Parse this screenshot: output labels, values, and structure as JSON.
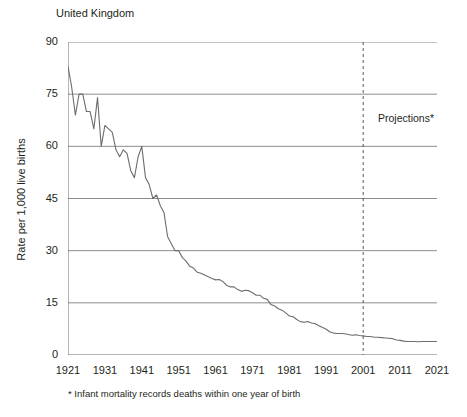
{
  "chart_data": {
    "type": "line",
    "title": "United Kingdom",
    "xlabel": "",
    "ylabel": "Rate per 1,000 live births",
    "xlim": [
      1921,
      2021
    ],
    "ylim": [
      0,
      90
    ],
    "grid": true,
    "legend": false,
    "y_ticks": [
      0,
      15,
      30,
      45,
      60,
      75,
      90
    ],
    "y_tick_labels": [
      "0",
      "15",
      "30",
      "45",
      "60",
      "75",
      "90"
    ],
    "x_ticks": [
      1921,
      1931,
      1941,
      1951,
      1961,
      1971,
      1981,
      1991,
      2001,
      2011,
      2021
    ],
    "x_tick_labels": [
      "1921",
      "1931",
      "1941",
      "1951",
      "1961",
      "1971",
      "1981",
      "1991",
      "2001",
      "2011",
      "2021"
    ],
    "annotations": [
      {
        "name": "projection-divider",
        "text": "Projections*",
        "x": 2001,
        "style": "vertical-dashed-line"
      }
    ],
    "footnote": "* Infant mortality records deaths within one year of birth",
    "line_color": "#6d6d6d",
    "grid_color": "#8c8c8c",
    "axis_color": "#6d6d6d",
    "series": [
      {
        "name": "Infant mortality rate",
        "x": [
          1921,
          1922,
          1923,
          1924,
          1925,
          1926,
          1927,
          1928,
          1929,
          1930,
          1931,
          1932,
          1933,
          1934,
          1935,
          1936,
          1937,
          1938,
          1939,
          1940,
          1941,
          1942,
          1943,
          1944,
          1945,
          1946,
          1947,
          1948,
          1949,
          1950,
          1951,
          1952,
          1953,
          1954,
          1955,
          1956,
          1957,
          1958,
          1959,
          1960,
          1961,
          1962,
          1963,
          1964,
          1965,
          1966,
          1967,
          1968,
          1969,
          1970,
          1971,
          1972,
          1973,
          1974,
          1975,
          1976,
          1977,
          1978,
          1979,
          1980,
          1981,
          1982,
          1983,
          1984,
          1985,
          1986,
          1987,
          1988,
          1989,
          1990,
          1991,
          1992,
          1993,
          1994,
          1995,
          1996,
          1997,
          1998,
          1999,
          2000,
          2001,
          2002,
          2003,
          2004,
          2005,
          2006,
          2007,
          2008,
          2009,
          2010,
          2011,
          2012,
          2013,
          2014,
          2015,
          2016,
          2017,
          2018,
          2019,
          2020,
          2021
        ],
        "values": [
          83.0,
          77.0,
          69.0,
          75.0,
          75.0,
          70.0,
          70.0,
          65.0,
          74.0,
          60.0,
          66.0,
          65.0,
          64.0,
          59.0,
          57.0,
          59.0,
          58.0,
          53.0,
          51.0,
          57.0,
          60.0,
          51.0,
          49.0,
          45.0,
          46.0,
          43.0,
          41.0,
          34.0,
          32.0,
          30.0,
          30.0,
          28.0,
          27.0,
          25.5,
          25.0,
          23.8,
          23.5,
          23.0,
          22.5,
          22.0,
          21.6,
          21.7,
          21.1,
          20.0,
          19.6,
          19.6,
          18.8,
          18.3,
          18.6,
          18.5,
          17.9,
          17.2,
          17.2,
          16.3,
          16.0,
          14.5,
          14.1,
          13.3,
          12.9,
          12.1,
          11.2,
          11.0,
          10.2,
          9.6,
          9.4,
          9.6,
          9.2,
          9.0,
          8.4,
          7.9,
          7.4,
          6.6,
          6.3,
          6.2,
          6.2,
          6.1,
          5.9,
          5.7,
          5.8,
          5.6,
          5.5,
          5.3,
          5.3,
          5.1,
          5.1,
          5.0,
          4.9,
          4.8,
          4.7,
          4.3,
          4.2,
          4.0,
          3.9,
          3.9,
          3.9,
          3.8,
          3.9,
          3.9,
          3.9,
          3.9,
          3.9
        ]
      }
    ]
  }
}
